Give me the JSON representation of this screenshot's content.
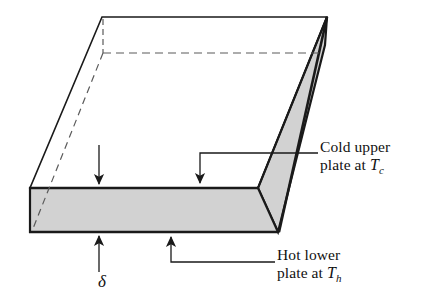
{
  "figure": {
    "colors": {
      "line": "#1a1a1a",
      "face_fill": "#d2d2d2",
      "top_fill": "#ffffff",
      "background": "#ffffff",
      "hidden_edge": "#5a5a5a"
    }
  },
  "labels": {
    "cold_plate": {
      "line1": "Cold upper",
      "line2_prefix": "plate at ",
      "symbol": "T",
      "subscript": "c"
    },
    "hot_plate": {
      "line1": "Hot lower",
      "line2_prefix": "plate at ",
      "symbol": "T",
      "subscript": "h"
    },
    "thickness": {
      "symbol": "δ"
    }
  },
  "annotations": {
    "arrows": [
      {
        "name": "thickness-top-arrow",
        "direction": "down",
        "target": "top surface of slab"
      },
      {
        "name": "cold-plate-arrow",
        "direction": "down",
        "target": "top surface of slab"
      },
      {
        "name": "thickness-bottom-arrow",
        "direction": "up",
        "target": "bottom surface of slab"
      },
      {
        "name": "hot-plate-arrow",
        "direction": "up",
        "target": "bottom surface of slab"
      }
    ]
  }
}
